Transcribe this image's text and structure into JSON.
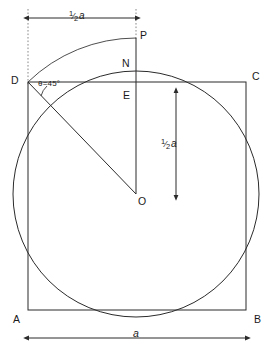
{
  "figure": {
    "background_color": "#ffffff",
    "line_color": "#2b2b2b",
    "guide_color": "#7a7a7a"
  },
  "points": {
    "A": "A",
    "B": "B",
    "C": "C",
    "D": "D",
    "E": "E",
    "N": "N",
    "O": "O",
    "P": "P"
  },
  "annotations": {
    "angle": "θ=45°",
    "half_a_numerator": "1",
    "half_a_bar": "⁄",
    "half_a_denominator": "2",
    "half_a_unit": "a",
    "side_label": "a"
  },
  "geometry": {
    "square": {
      "left": 28,
      "top": 82,
      "right": 246,
      "bottom": 310,
      "side_px": 218
    },
    "circle": {
      "cx": 136,
      "cy": 194,
      "r": 123
    },
    "arc_DP": {
      "from_x": 28,
      "from_y": 82,
      "to_x": 136,
      "to_y": 38,
      "radius": 156
    },
    "vertical_line_PO": {
      "x": 136,
      "y1": 38,
      "y2": 194
    },
    "diagonal_DO": {
      "x1": 28,
      "y1": 82,
      "x2": 136,
      "y2": 194
    },
    "top_dimension": {
      "y": 18,
      "x1": 28,
      "x2": 136
    },
    "right_dimension": {
      "x": 176,
      "y1": 92,
      "y2": 196
    },
    "bottom_dimension": {
      "y": 338,
      "x1": 28,
      "x2": 246
    }
  }
}
